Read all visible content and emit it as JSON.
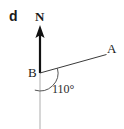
{
  "figure": {
    "part_label": "d",
    "labels": {
      "north": "N",
      "vertex": "B",
      "point_a": "A",
      "angle": "110°"
    },
    "colors": {
      "background": "#ffffff",
      "ink": "#1a1a1a",
      "north_arrow": "#111111",
      "ray": "#3a3a3a",
      "south_line": "#cccccc",
      "arc": "#555555"
    },
    "geometry": {
      "vertex": {
        "x": 40,
        "y": 73
      },
      "north_arrow": {
        "tip_x": 40,
        "tip_y": 26,
        "tail_x": 40,
        "tail_y": 73
      },
      "ray_ba": {
        "end_x": 106,
        "end_y": 55
      },
      "south_line": {
        "end_x": 40,
        "end_y": 129
      },
      "angle_arc_radius": 18,
      "angle_value_degrees": 110
    }
  }
}
